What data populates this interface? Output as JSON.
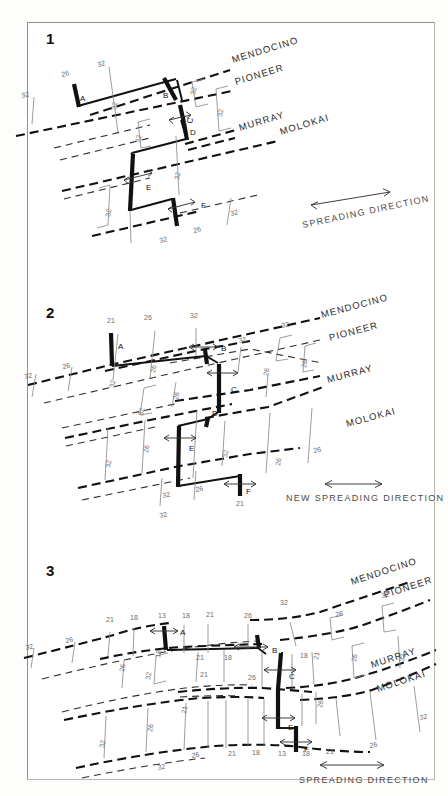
{
  "figure": {
    "panel_count": 3,
    "colors": {
      "paper": "#ffffff",
      "ink": "#111111",
      "anomaly_label": "#6d6d6d",
      "fracture_zone": "#111111",
      "isochron": "#8a8a8a"
    }
  },
  "panels": [
    {
      "number": "1",
      "spreading_label": "SPREADING DIRECTION",
      "fracture_zones": [
        "MENDOCINO",
        "PIONEER",
        "MURRAY",
        "MOLOKAI"
      ],
      "ridge_segments": [
        "A",
        "B",
        "C",
        "D",
        "E",
        "F"
      ],
      "anomaly_labels": [
        "32",
        "26",
        "32",
        "32",
        "32",
        "32",
        "32",
        "32",
        "32",
        "32",
        "26",
        "32"
      ],
      "anomalies_present": [
        "26",
        "32"
      ]
    },
    {
      "number": "2",
      "spreading_label": "NEW SPREADING DIRECTION",
      "fracture_zones": [
        "MENDOCINO",
        "PIONEER",
        "MURRAY",
        "MOLOKAI"
      ],
      "ridge_segments": [
        "A",
        "B",
        "C",
        "D",
        "E",
        "F"
      ],
      "anomaly_labels": [
        "21",
        "26",
        "32",
        "26",
        "32",
        "32",
        "26",
        "32",
        "26",
        "26",
        "32",
        "26",
        "32",
        "32",
        "26",
        "32",
        "26",
        "21",
        "32",
        "26"
      ],
      "anomalies_present": [
        "21",
        "26",
        "32"
      ]
    },
    {
      "number": "3",
      "spreading_label": "SPREADING DIRECTION",
      "fracture_zones": [
        "MENDOCINO",
        "PIONEER",
        "MURRAY",
        "MOLOKAI"
      ],
      "ridge_segments": [
        "A",
        "B",
        "C",
        "D",
        "E",
        "F"
      ],
      "anomaly_labels": [
        "13",
        "18",
        "21",
        "26",
        "32",
        "18",
        "21",
        "26",
        "32",
        "13",
        "18",
        "21",
        "26",
        "32",
        "18",
        "21",
        "26",
        "32"
      ],
      "anomalies_present": [
        "13",
        "18",
        "21",
        "26",
        "32"
      ]
    }
  ],
  "panel1": {
    "number": "1",
    "fz": {
      "mendocino": "MENDOCINO",
      "pioneer": "PIONEER",
      "murray": "MURRAY",
      "molokai": "MOLOKAI"
    },
    "seg": {
      "a": "A",
      "b": "B",
      "c": "C",
      "d": "D",
      "e": "E",
      "f": "F"
    },
    "spreading": "SPREADING DIRECTION",
    "an": {
      "a1": "32",
      "a2": "26",
      "a3": "32",
      "a4": "32",
      "a5": "32",
      "a6": "32",
      "a7": "32",
      "a8": "32",
      "a9": "32",
      "a10": "32",
      "a11": "26",
      "a12": "32"
    }
  },
  "panel2": {
    "number": "2",
    "fz": {
      "mendocino": "MENDOCINO",
      "pioneer": "PIONEER",
      "murray": "MURRAY",
      "molokai": "MOLOKAI"
    },
    "seg": {
      "a": "A",
      "b": "B",
      "c": "C",
      "d": "D",
      "e": "E",
      "f": "F"
    },
    "spreading": "NEW SPREADING DIRECTION",
    "an": {
      "a1": "32",
      "a2": "26",
      "a3": "21",
      "a4": "26",
      "a5": "32",
      "a6": "32",
      "a7": "26",
      "a8": "32",
      "a9": "26",
      "a10": "32",
      "a11": "32",
      "a12": "26",
      "a13": "26",
      "a14": "32",
      "a15": "26",
      "a16": "32",
      "a17": "26",
      "a18": "32",
      "a19": "21",
      "a20": "26",
      "a21": "26",
      "a22": "32"
    }
  },
  "panel3": {
    "number": "3",
    "fz": {
      "mendocino": "MENDOCINO",
      "pioneer": "PIONEER",
      "murray": "MURRAY",
      "molokai": "MOLOKAI"
    },
    "seg": {
      "a": "A",
      "b": "B",
      "c": "C",
      "d": "D",
      "e": "E",
      "f": "F"
    },
    "spreading": "SPREADING DIRECTION",
    "an": {
      "a1": "32",
      "a2": "26",
      "a3": "21",
      "a4": "18",
      "a5": "13",
      "a6": "18",
      "a7": "21",
      "a8": "26",
      "a9": "32",
      "a10": "32",
      "a11": "26",
      "a12": "21",
      "a13": "18",
      "a14": "26",
      "a15": "32",
      "a16": "26",
      "a17": "18",
      "a18": "21",
      "a19": "18",
      "a20": "21",
      "a21": "26",
      "a22": "32",
      "a23": "32",
      "a24": "26",
      "a25": "32",
      "a26": "26",
      "a27": "21",
      "a28": "18",
      "a29": "13",
      "a30": "18",
      "a31": "21",
      "a32": "26",
      "a33": "32",
      "a34": "21",
      "a35": "26",
      "a36": "32",
      "a37": "26",
      "a38": "32"
    }
  }
}
